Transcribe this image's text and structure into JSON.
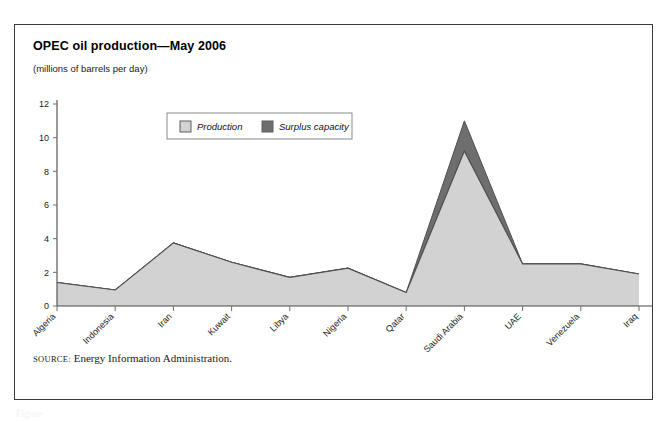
{
  "figure": {
    "title": "OPEC oil production—May 2006",
    "subtitle": "(millions of barrels per day)",
    "source_label": "SOURCE:",
    "source_text": "Energy Information Administration.",
    "caption_partial": "Figure"
  },
  "colors": {
    "production_fill": "#d2d2d2",
    "surplus_fill": "#6e6e6e",
    "outline": "#4f4f4f",
    "frame_border": "#3b3b3b",
    "axis": "#4a4a4a",
    "text": "#1a1a1a",
    "background": "#ffffff"
  },
  "chart_data": {
    "type": "area",
    "stacked": true,
    "title": "OPEC oil production—May 2006",
    "subtitle": "(millions of barrels per day)",
    "xlabel": "",
    "ylabel": "",
    "ylim": [
      0,
      12
    ],
    "yticks": [
      0,
      2,
      4,
      6,
      8,
      10,
      12
    ],
    "grid": false,
    "legend_position": "top-center-inside",
    "categories": [
      "Algeria",
      "Indonesia",
      "Iran",
      "Kuwait",
      "Libya",
      "Nigeria",
      "Qatar",
      "Saudi Arabia",
      "UAE",
      "Venezuela",
      "Iraq"
    ],
    "series": [
      {
        "name": "Production",
        "color": "#d2d2d2",
        "values": [
          1.4,
          0.95,
          3.75,
          2.6,
          1.7,
          2.25,
          0.8,
          9.2,
          2.5,
          2.5,
          1.9
        ]
      },
      {
        "name": "Surplus capacity",
        "color": "#6e6e6e",
        "values": [
          0.0,
          0.0,
          0.0,
          0.0,
          0.0,
          0.0,
          0.0,
          1.8,
          0.0,
          0.0,
          0.0
        ]
      }
    ],
    "totals": [
      1.4,
      0.95,
      3.75,
      2.6,
      1.7,
      2.25,
      0.8,
      11.0,
      2.5,
      2.5,
      1.9
    ]
  }
}
